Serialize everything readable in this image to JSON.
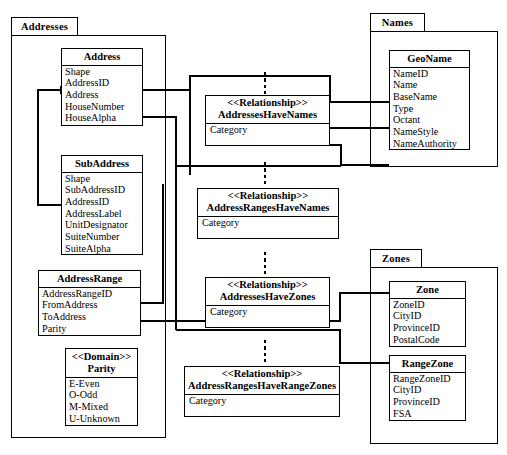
{
  "diagram": {
    "packages": [
      {
        "id": "addresses",
        "name": "Addresses"
      },
      {
        "id": "names",
        "name": "Names"
      },
      {
        "id": "zones",
        "name": "Zones"
      }
    ],
    "classes": [
      {
        "id": "address",
        "stereotype": "",
        "name": "Address",
        "attributes": [
          "Shape",
          "AddressID",
          "Address",
          "HouseNumber",
          "HouseAlpha"
        ]
      },
      {
        "id": "subaddress",
        "stereotype": "",
        "name": "SubAddress",
        "attributes": [
          "Shape",
          "SubAddressID",
          "AddressID",
          "AddressLabel",
          "UnitDesignator",
          "SuiteNumber",
          "SuiteAlpha"
        ]
      },
      {
        "id": "addressrange",
        "stereotype": "",
        "name": "AddressRange",
        "attributes": [
          "AddressRangeID",
          "FromAddress",
          "ToAddress",
          "Parity"
        ]
      },
      {
        "id": "parity",
        "stereotype": "<<Domain>>",
        "name": "Parity",
        "attributes": [
          "E-Even",
          "O-Odd",
          "M-Mixed",
          "U-Unknown"
        ]
      },
      {
        "id": "geoname",
        "stereotype": "",
        "name": "GeoName",
        "attributes": [
          "NameID",
          "Name",
          "BaseName",
          "Type",
          "Octant",
          "NameStyle",
          "NameAuthority"
        ]
      },
      {
        "id": "zone",
        "stereotype": "",
        "name": "Zone",
        "attributes": [
          "ZoneID",
          "CityID",
          "ProvinceID",
          "PostalCode"
        ]
      },
      {
        "id": "rangezone",
        "stereotype": "",
        "name": "RangeZone",
        "attributes": [
          "RangeZoneID",
          "CityID",
          "ProvinceID",
          "FSA"
        ]
      },
      {
        "id": "rel_addresseshavenames",
        "stereotype": "<<Relationship>>",
        "name": "AddressesHaveNames",
        "attributes": [
          "Category"
        ]
      },
      {
        "id": "rel_addressrangeshavenames",
        "stereotype": "<<Relationship>>",
        "name": "AddressRangesHaveNames",
        "attributes": [
          "Category"
        ]
      },
      {
        "id": "rel_addresseshavezones",
        "stereotype": "<<Relationship>>",
        "name": "AddressesHaveZones",
        "attributes": [
          "Category"
        ]
      },
      {
        "id": "rel_addressrangeshaverangezones",
        "stereotype": "<<Relationship>>",
        "name": "AddressRangesHaveRangeZones",
        "attributes": [
          "Category"
        ]
      }
    ],
    "colors": {
      "line": "#000000",
      "background": "#ffffff",
      "text": "#000000"
    }
  }
}
